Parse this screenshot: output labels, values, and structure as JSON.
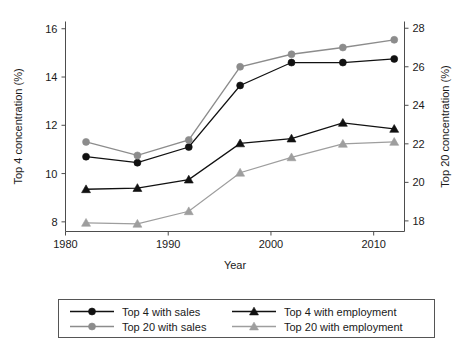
{
  "chart_data": {
    "type": "line",
    "title": "",
    "subtitle": "",
    "xlabel": "Year",
    "ylabel": "Top 4 concentration (%)",
    "y2label": "Top 20 concentration (%)",
    "x": [
      1982,
      1987,
      1992,
      1997,
      2002,
      2007,
      2012
    ],
    "xlim": [
      1980,
      2013
    ],
    "xticks": [
      1980,
      1990,
      2000,
      2010
    ],
    "xtick_labels": [
      "1980",
      "1990",
      "2000",
      "2010"
    ],
    "ylim": [
      7.6,
      16.3
    ],
    "yticks": [
      8,
      10,
      12,
      14,
      16
    ],
    "ytick_labels": [
      "8",
      "10",
      "12",
      "14",
      "16"
    ],
    "y2lim": [
      17.45,
      28.35
    ],
    "y2ticks": [
      18,
      20,
      22,
      24,
      26,
      28
    ],
    "y2tick_labels": [
      "18",
      "20",
      "22",
      "24",
      "26",
      "28"
    ],
    "grid": false,
    "legend_position": "below-plot",
    "series": [
      {
        "name": "Top 4 with sales",
        "axis": "left",
        "marker": "circle",
        "color": "#111111",
        "values": [
          10.7,
          10.45,
          11.1,
          13.65,
          14.6,
          14.6,
          14.75
        ]
      },
      {
        "name": "Top 4 with employment",
        "axis": "left",
        "marker": "triangle",
        "color": "#111111",
        "values": [
          9.35,
          9.4,
          9.75,
          11.25,
          11.45,
          12.1,
          11.85
        ]
      },
      {
        "name": "Top 20 with sales",
        "axis": "right",
        "marker": "circle",
        "color": "#8c8c8c",
        "values": [
          22.1,
          21.4,
          22.2,
          26.0,
          26.65,
          27.0,
          27.4
        ]
      },
      {
        "name": "Top 20 with employment",
        "axis": "right",
        "marker": "triangle",
        "color": "#9e9e9e",
        "values": [
          17.9,
          17.85,
          18.5,
          20.5,
          21.3,
          22.0,
          22.1
        ]
      }
    ]
  },
  "legend": {
    "entries": [
      {
        "label": "Top 4 with sales",
        "marker": "circle",
        "color": "#111111"
      },
      {
        "label": "Top 4 with employment",
        "marker": "triangle",
        "color": "#111111"
      },
      {
        "label": "Top 20 with sales",
        "marker": "circle",
        "color": "#8c8c8c"
      },
      {
        "label": "Top 20 with employment",
        "marker": "triangle",
        "color": "#9e9e9e"
      }
    ]
  },
  "axes": {
    "left_title": "Top 4 concentration (%)",
    "right_title": "Top 20 concentration (%)",
    "bottom_title": "Year"
  }
}
